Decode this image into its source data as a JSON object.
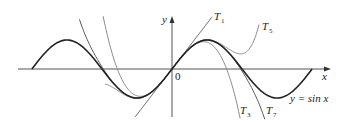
{
  "chart_data": {
    "type": "line",
    "title": "",
    "xlabel": "x",
    "ylabel": "y",
    "origin_label": "0",
    "grid": false,
    "legend": "none (curve labels placed directly on curves)",
    "xlim": [
      -7.0,
      7.2
    ],
    "ylim": [
      -1.6,
      1.85
    ],
    "series": [
      {
        "name": "y = sin x",
        "label": "y = sin x",
        "expr": "sin(x)",
        "x_range": [
          -6.283,
          6.283
        ],
        "style": "dark, thick"
      },
      {
        "name": "T1",
        "label": "T1",
        "expr": "x",
        "x_range": [
          -1.65,
          1.8
        ],
        "style": "dark, thin"
      },
      {
        "name": "T3",
        "label": "T3",
        "expr": "x - x^3/6",
        "x_range": [
          -3.9,
          3.9
        ],
        "style": "gray"
      },
      {
        "name": "T5",
        "label": "T5",
        "expr": "x - x^3/6 + x^5/120",
        "x_range": [
          -3.0,
          3.9
        ],
        "style": "gray"
      },
      {
        "name": "T7",
        "label": "T7",
        "expr": "x - x^3/6 + x^5/120 - x^7/5040",
        "x_range": [
          -4.15,
          4.3
        ],
        "style": "dark gray"
      }
    ],
    "annotations": [
      "T1",
      "T3",
      "T5",
      "T7",
      "y = sin x",
      "0",
      "x",
      "y"
    ]
  },
  "labels": {
    "x_axis": "x",
    "y_axis": "y",
    "origin": "0",
    "t1": "T",
    "t1_sub": "1",
    "t3": "T",
    "t3_sub": "3",
    "t5": "T",
    "t5_sub": "5",
    "t7": "T",
    "t7_sub": "7",
    "sin_label": "y = sin x"
  }
}
